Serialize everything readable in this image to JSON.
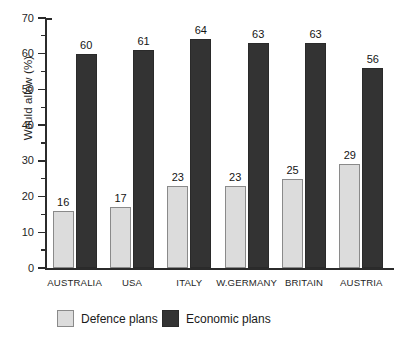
{
  "chart_data": {
    "type": "bar",
    "title": "",
    "subtitle": "",
    "xlabel": "",
    "ylabel": "Would allow (%)",
    "ylim": [
      0,
      70
    ],
    "ytick_step": 10,
    "yminor_tick_step": 5,
    "grid": false,
    "legend_position": "bottom-left",
    "categories": [
      "AUSTRALIA",
      "USA",
      "ITALY",
      "W.GERMANY",
      "BRITAIN",
      "AUSTRIA"
    ],
    "series": [
      {
        "name": "Defence plans",
        "color": "#dcdcdc",
        "values": [
          16,
          17,
          23,
          23,
          25,
          29
        ]
      },
      {
        "name": "Economic plans",
        "color": "#333333",
        "values": [
          60,
          61,
          64,
          63,
          63,
          56
        ]
      }
    ],
    "ytick_labels": [
      "0",
      "10",
      "20",
      "30",
      "40",
      "50",
      "60",
      "70"
    ],
    "data_labels_shown": true
  },
  "axis": {
    "y_title": "Would allow (%)",
    "ticks": [
      {
        "value": 0,
        "label": "0"
      },
      {
        "value": 10,
        "label": "10"
      },
      {
        "value": 20,
        "label": "20"
      },
      {
        "value": 30,
        "label": "30"
      },
      {
        "value": 40,
        "label": "40"
      },
      {
        "value": 50,
        "label": "50"
      },
      {
        "value": 60,
        "label": "60"
      },
      {
        "value": 70,
        "label": "70"
      }
    ]
  },
  "legend": {
    "items": [
      {
        "label": "Defence plans",
        "swatch": "light"
      },
      {
        "label": "Economic plans",
        "swatch": "dark"
      }
    ]
  }
}
